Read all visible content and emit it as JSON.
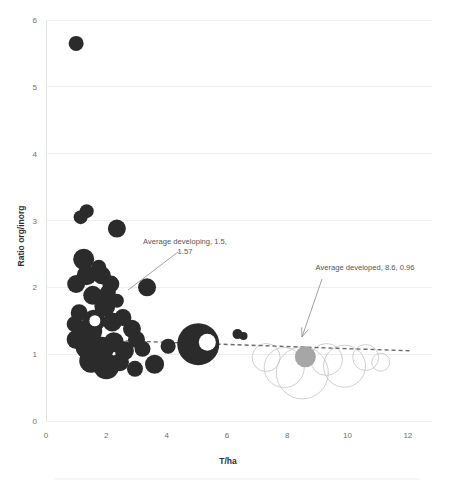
{
  "chart_data": {
    "type": "scatter",
    "title": "",
    "xlabel": "T/ha",
    "ylabel": "Ratio org/inorg",
    "xlim": [
      0,
      12.8
    ],
    "ylim": [
      0,
      6
    ],
    "xticks": [
      "0",
      "2",
      "4",
      "6",
      "8",
      "10",
      "12"
    ],
    "xtick_values": [
      0,
      2,
      4,
      6,
      8,
      10,
      12
    ],
    "yticks": [
      "0",
      "1",
      "2",
      "3",
      "4",
      "5",
      "6"
    ],
    "ytick_values": [
      0,
      1,
      2,
      3,
      4,
      5,
      6
    ],
    "grid": true,
    "legend": "none",
    "series": [
      {
        "name": "developing",
        "color": "#2b2b2b",
        "points": [
          {
            "x": 1.0,
            "y": 5.65,
            "r": 7.5
          },
          {
            "x": 1.35,
            "y": 3.14,
            "r": 7.0
          },
          {
            "x": 1.15,
            "y": 3.05,
            "r": 7.0
          },
          {
            "x": 1.25,
            "y": 2.42,
            "r": 10.5
          },
          {
            "x": 1.35,
            "y": 2.18,
            "r": 10.0
          },
          {
            "x": 1.0,
            "y": 2.05,
            "r": 9.0
          },
          {
            "x": 1.85,
            "y": 2.18,
            "r": 9.0
          },
          {
            "x": 1.75,
            "y": 2.3,
            "r": 7.5
          },
          {
            "x": 2.15,
            "y": 2.05,
            "r": 8.5
          },
          {
            "x": 2.05,
            "y": 1.92,
            "r": 8.0
          },
          {
            "x": 1.55,
            "y": 1.88,
            "r": 9.5
          },
          {
            "x": 1.95,
            "y": 1.72,
            "r": 10.5
          },
          {
            "x": 2.35,
            "y": 1.8,
            "r": 7.0
          },
          {
            "x": 3.35,
            "y": 2.0,
            "r": 9.0
          },
          {
            "x": 1.1,
            "y": 1.62,
            "r": 8.5
          },
          {
            "x": 0.95,
            "y": 1.45,
            "r": 8.0
          },
          {
            "x": 1.6,
            "y": 1.5,
            "r": 11.0
          },
          {
            "x": 1.45,
            "y": 1.35,
            "r": 12.5
          },
          {
            "x": 2.2,
            "y": 1.48,
            "r": 9.5
          },
          {
            "x": 2.55,
            "y": 1.55,
            "r": 8.5
          },
          {
            "x": 2.85,
            "y": 1.38,
            "r": 9.0
          },
          {
            "x": 1.0,
            "y": 1.22,
            "r": 9.5
          },
          {
            "x": 1.35,
            "y": 1.1,
            "r": 11.0
          },
          {
            "x": 1.85,
            "y": 1.08,
            "r": 12.0
          },
          {
            "x": 2.25,
            "y": 1.18,
            "r": 10.0
          },
          {
            "x": 2.6,
            "y": 1.05,
            "r": 9.5
          },
          {
            "x": 3.0,
            "y": 1.22,
            "r": 8.5
          },
          {
            "x": 3.2,
            "y": 1.08,
            "r": 8.0
          },
          {
            "x": 1.5,
            "y": 0.9,
            "r": 12.0
          },
          {
            "x": 2.0,
            "y": 0.82,
            "r": 13.0
          },
          {
            "x": 2.45,
            "y": 0.88,
            "r": 9.0
          },
          {
            "x": 2.95,
            "y": 0.78,
            "r": 8.0
          },
          {
            "x": 3.6,
            "y": 0.85,
            "r": 9.5
          },
          {
            "x": 4.05,
            "y": 1.12,
            "r": 7.5
          },
          {
            "x": 5.05,
            "y": 1.15,
            "r": 21.0
          },
          {
            "x": 6.35,
            "y": 1.3,
            "r": 5.0
          },
          {
            "x": 6.55,
            "y": 1.27,
            "r": 4.0
          },
          {
            "x": 2.35,
            "y": 2.88,
            "r": 9.0
          }
        ]
      },
      {
        "name": "average-developed",
        "color": "#a6a6a6",
        "points": [
          {
            "x": 8.6,
            "y": 0.96,
            "r": 10.5
          }
        ]
      }
    ],
    "ghost_bubbles": [
      {
        "x": 7.3,
        "y": 0.95,
        "r": 14
      },
      {
        "x": 7.9,
        "y": 0.8,
        "r": 20
      },
      {
        "x": 8.5,
        "y": 0.72,
        "r": 26
      },
      {
        "x": 9.3,
        "y": 0.92,
        "r": 16
      },
      {
        "x": 9.9,
        "y": 0.82,
        "r": 21
      },
      {
        "x": 10.6,
        "y": 0.95,
        "r": 13
      },
      {
        "x": 11.1,
        "y": 0.88,
        "r": 9
      }
    ],
    "trendline": {
      "style": "dashed",
      "color": "#6b6b6b",
      "x_start": 1.25,
      "y_start": 1.22,
      "x_end": 12.1,
      "y_end": 1.05
    },
    "annotations": [
      {
        "id": "average-developing",
        "lines": [
          "Average   developing, 1.5,",
          "1.57"
        ],
        "text_x": 185,
        "text_y": 244,
        "anchor": "middle",
        "leader_from_x": 178,
        "leader_from_y": 252,
        "leader_to_x": 128,
        "leader_to_y": 290
      },
      {
        "id": "average-developed",
        "lines": [
          "Average developed, 8.6, 0.96"
        ],
        "text_x": 365,
        "text_y": 270,
        "anchor": "middle",
        "leader_from_x": 322,
        "leader_from_y": 279,
        "leader_to_x": 302,
        "leader_to_y": 337
      }
    ]
  }
}
